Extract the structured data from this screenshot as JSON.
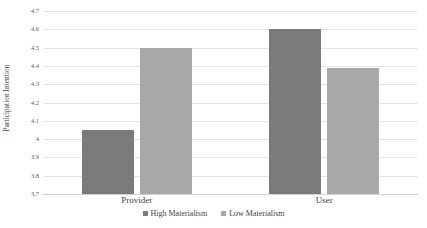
{
  "chart_data": {
    "type": "bar",
    "title": "",
    "xlabel": "",
    "ylabel": "Participation Intention",
    "ylim": [
      3.7,
      4.7
    ],
    "ytick_step": 0.1,
    "yticks": [
      "4.7",
      "4.6",
      "4.5",
      "4.4",
      "4.3",
      "4.2",
      "4.1",
      "4",
      "3.9",
      "3.8",
      "3.7"
    ],
    "ytick_values": [
      4.7,
      4.6,
      4.5,
      4.4,
      4.3,
      4.2,
      4.1,
      4.0,
      3.9,
      3.8,
      3.7
    ],
    "categories": [
      "Provider",
      "User"
    ],
    "series": [
      {
        "name": "High Materialism",
        "color": "#7b7b7b",
        "values": [
          4.05,
          4.6
        ]
      },
      {
        "name": "Low Materialism",
        "color": "#a8a8a8",
        "values": [
          4.5,
          4.39
        ]
      }
    ],
    "grid": true,
    "legend_position": "bottom",
    "annotations": []
  },
  "colors": {
    "background": "#ffffff",
    "gridline": "#e4e4e4",
    "axis": "#d0d0d0",
    "text": "#3f3f3f",
    "tick_text": "#595959"
  }
}
